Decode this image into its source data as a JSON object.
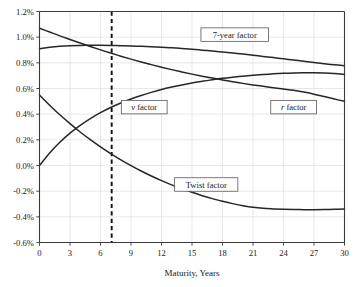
{
  "chart_data": {
    "type": "line",
    "title": "",
    "xlabel": "Maturity, Years",
    "ylabel": "",
    "xlim": [
      0,
      30
    ],
    "ylim": [
      -0.6,
      1.2
    ],
    "grid": true,
    "legend_position": "inline-labels",
    "x_ticks": [
      "0",
      "3",
      "6",
      "9",
      "12",
      "15",
      "18",
      "21",
      "24",
      "27",
      "30"
    ],
    "x_tick_values": [
      0,
      3,
      6,
      9,
      12,
      15,
      18,
      21,
      24,
      27,
      30
    ],
    "y_ticks": [
      "1.2%",
      "1.0%",
      "0.8%",
      "0.6%",
      "0.4%",
      "0.2%",
      "0.0%",
      "-0.2%",
      "-0.4%",
      "-0.6%"
    ],
    "y_tick_values": [
      1.2,
      1.0,
      0.8,
      0.6,
      0.4,
      0.2,
      0.0,
      -0.2,
      -0.4,
      -0.6
    ],
    "annotations": [
      {
        "name": "reference-line",
        "type": "vertical-dashed",
        "x": 7.1,
        "label": ""
      }
    ],
    "x": [
      0,
      1,
      2,
      3,
      4,
      5,
      6,
      7,
      8,
      9,
      10,
      11,
      12,
      13,
      14,
      15,
      16,
      17,
      18,
      19,
      20,
      21,
      22,
      23,
      24,
      25,
      26,
      27,
      28,
      29,
      30
    ],
    "series": [
      {
        "name": "7-year factor",
        "label": "7-year factor",
        "label_x": 19.2,
        "label_y": 1.02,
        "color": "#262626",
        "values": [
          0.91,
          0.921,
          0.929,
          0.934,
          0.936,
          0.937,
          0.937,
          0.936,
          0.934,
          0.932,
          0.929,
          0.926,
          0.922,
          0.917,
          0.912,
          0.906,
          0.899,
          0.892,
          0.884,
          0.876,
          0.868,
          0.859,
          0.85,
          0.841,
          0.831,
          0.822,
          0.812,
          0.802,
          0.793,
          0.785,
          0.778
        ]
      },
      {
        "name": "r factor",
        "label": "r factor",
        "label_italic_prefix": "r",
        "label_rest": " factor",
        "label_x": 25.0,
        "label_y": 0.455,
        "color": "#262626",
        "values": [
          1.07,
          1.04,
          1.01,
          0.982,
          0.954,
          0.927,
          0.901,
          0.876,
          0.852,
          0.829,
          0.807,
          0.786,
          0.766,
          0.747,
          0.729,
          0.712,
          0.696,
          0.681,
          0.667,
          0.653,
          0.64,
          0.628,
          0.617,
          0.606,
          0.596,
          0.586,
          0.572,
          0.556,
          0.537,
          0.518,
          0.5
        ]
      },
      {
        "name": "v factor",
        "label": "v factor",
        "label_italic_prefix": "v",
        "label_rest": " factor",
        "label_x": 10.3,
        "label_y": 0.455,
        "color": "#262626",
        "values": [
          0.0,
          0.098,
          0.181,
          0.252,
          0.313,
          0.366,
          0.412,
          0.452,
          0.487,
          0.518,
          0.546,
          0.57,
          0.592,
          0.611,
          0.628,
          0.643,
          0.656,
          0.668,
          0.679,
          0.688,
          0.696,
          0.703,
          0.709,
          0.714,
          0.718,
          0.721,
          0.722,
          0.722,
          0.72,
          0.716,
          0.71
        ]
      },
      {
        "name": "Twist factor",
        "label": "Twist factor",
        "label_x": 16.4,
        "label_y": -0.148,
        "color": "#262626",
        "values": [
          0.55,
          0.47,
          0.395,
          0.326,
          0.261,
          0.201,
          0.145,
          0.093,
          0.044,
          -0.001,
          -0.043,
          -0.082,
          -0.118,
          -0.151,
          -0.181,
          -0.209,
          -0.235,
          -0.258,
          -0.279,
          -0.297,
          -0.313,
          -0.326,
          -0.334,
          -0.338,
          -0.341,
          -0.343,
          -0.344,
          -0.344,
          -0.343,
          -0.341,
          -0.338
        ]
      }
    ]
  },
  "axis": {
    "x_title": "Maturity, Years"
  }
}
